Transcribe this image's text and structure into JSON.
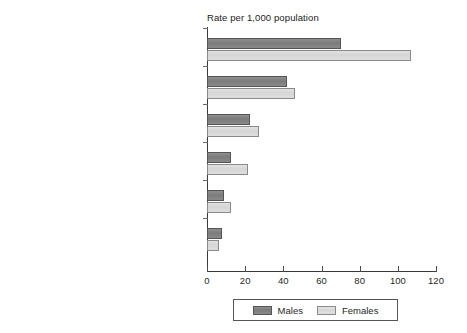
{
  "chart_data": {
    "type": "bar",
    "orientation": "horizontal",
    "title": "Rate per 1,000 population",
    "xlabel": "",
    "ylabel": "",
    "xlim": [
      0,
      120
    ],
    "xticks": [
      0,
      20,
      40,
      60,
      80,
      100,
      120
    ],
    "grid": false,
    "legend_position": "bottom-center",
    "categories": [
      "Mixed anxiety and depressive disorder",
      "Generalised anxiety disorder",
      "Depressive episode",
      "Phobia",
      "Obsessive compulsive disorder",
      "Panic disorder"
    ],
    "series": [
      {
        "name": "Males",
        "color": "#808080",
        "values": [
          70,
          42,
          22.5,
          12.5,
          9,
          8
        ]
      },
      {
        "name": "Females",
        "color": "#d9d9d9",
        "values": [
          107,
          46,
          27.5,
          21.5,
          12.5,
          6.5
        ]
      }
    ]
  },
  "legend": {
    "entries": [
      {
        "label": "Males"
      },
      {
        "label": "Females"
      }
    ]
  },
  "axis": {
    "tick_labels": [
      "0",
      "20",
      "40",
      "60",
      "80",
      "100",
      "120"
    ]
  }
}
